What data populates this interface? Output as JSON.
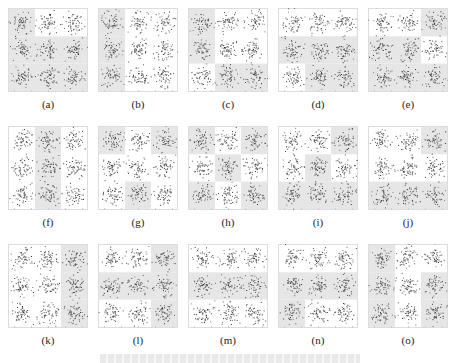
{
  "figure": {
    "panels": [
      {
        "label": "(a)",
        "shade": [
          1,
          0,
          0,
          1,
          1,
          1,
          1,
          1,
          1
        ]
      },
      {
        "label": "(b)",
        "shade": [
          1,
          0,
          0,
          1,
          0,
          0,
          1,
          0,
          0
        ]
      },
      {
        "label": "(c)",
        "shade": [
          1,
          0,
          0,
          1,
          0,
          0,
          0,
          1,
          1
        ]
      },
      {
        "label": "(d)",
        "shade": [
          0,
          0,
          0,
          1,
          1,
          1,
          0,
          1,
          1
        ]
      },
      {
        "label": "(e)",
        "shade": [
          0,
          0,
          1,
          1,
          1,
          0,
          1,
          1,
          1
        ]
      },
      {
        "label": "(f)",
        "shade": [
          0,
          1,
          0,
          0,
          1,
          0,
          0,
          1,
          0
        ]
      },
      {
        "label": "(g)",
        "shade": [
          1,
          0,
          1,
          0,
          0,
          0,
          0,
          1,
          0
        ]
      },
      {
        "label": "(h)",
        "shade": [
          1,
          0,
          1,
          0,
          1,
          0,
          1,
          0,
          1
        ]
      },
      {
        "label": "(i)",
        "shade": [
          0,
          0,
          1,
          0,
          1,
          0,
          1,
          1,
          1
        ]
      },
      {
        "label": "(j)",
        "shade": [
          0,
          0,
          1,
          0,
          0,
          0,
          1,
          1,
          1
        ]
      },
      {
        "label": "(k)",
        "shade": [
          0,
          0,
          1,
          0,
          0,
          1,
          0,
          0,
          1
        ]
      },
      {
        "label": "(l)",
        "shade": [
          0,
          0,
          1,
          1,
          1,
          1,
          0,
          0,
          1
        ]
      },
      {
        "label": "(m)",
        "shade": [
          0,
          0,
          0,
          1,
          1,
          1,
          0,
          0,
          0
        ]
      },
      {
        "label": "(n)",
        "shade": [
          0,
          0,
          0,
          1,
          1,
          1,
          1,
          0,
          0
        ]
      },
      {
        "label": "(o)",
        "shade": [
          1,
          0,
          0,
          1,
          0,
          1,
          1,
          0,
          1
        ]
      }
    ],
    "caption": ""
  },
  "chart_data": {
    "type": "scatter",
    "title": "",
    "grid_layout": [
      3,
      5
    ],
    "clusters_per_panel": 9,
    "cluster_layout": "3x3",
    "categories": [
      "(a)",
      "(b)",
      "(c)",
      "(d)",
      "(e)",
      "(f)",
      "(g)",
      "(h)",
      "(i)",
      "(j)",
      "(k)",
      "(l)",
      "(m)",
      "(n)",
      "(o)"
    ],
    "xlabel": "",
    "ylabel": "",
    "colors": {
      "points": "#333333",
      "shade": "#e6e6e6",
      "frame": "#dddddd"
    }
  }
}
